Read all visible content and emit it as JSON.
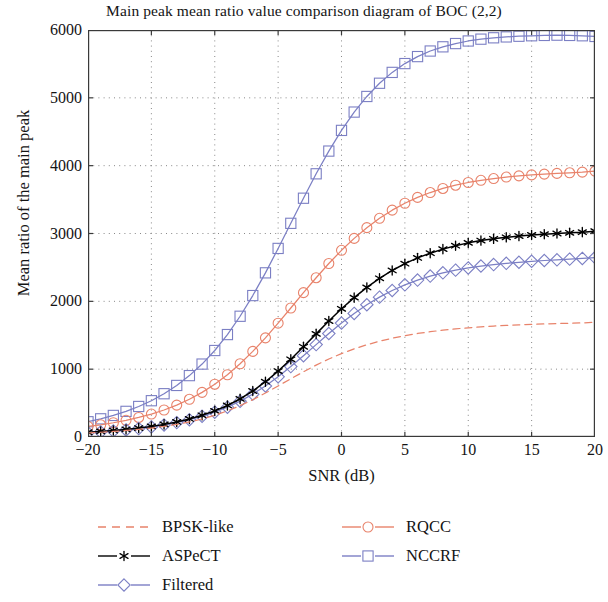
{
  "chart_data": {
    "type": "line",
    "title": "Main peak mean ratio value comparison diagram of BOC (2,2)",
    "xlabel": "SNR (dB)",
    "ylabel": "Mean ratio of the main peak",
    "xlim": [
      -20,
      20
    ],
    "ylim": [
      0,
      6000
    ],
    "xticks": [
      -20,
      -15,
      -10,
      -5,
      0,
      5,
      10,
      15,
      20
    ],
    "xticklabels": [
      "−20",
      "−15",
      "−10",
      "−5",
      "0",
      "5",
      "10",
      "15",
      "20"
    ],
    "yticks": [
      0,
      1000,
      2000,
      3000,
      4000,
      5000,
      6000
    ],
    "yticklabels": [
      "0",
      "1000",
      "2000",
      "3000",
      "4000",
      "5000",
      "6000"
    ],
    "grid": true,
    "grid_style": "dotted",
    "legend_position": "below-axes",
    "legend_columns": 2,
    "x": [
      -20,
      -19,
      -18,
      -17,
      -16,
      -15,
      -14,
      -13,
      -12,
      -11,
      -10,
      -9,
      -8,
      -7,
      -6,
      -5,
      -4,
      -3,
      -2,
      -1,
      0,
      1,
      2,
      3,
      4,
      5,
      6,
      7,
      8,
      9,
      10,
      11,
      12,
      13,
      14,
      15,
      16,
      17,
      18,
      19,
      20
    ],
    "series": [
      {
        "name": "BPSK-like",
        "color": "#E8836B",
        "line_style": "dashed",
        "marker": "none",
        "values": [
          60,
          70,
          82,
          96,
          112,
          132,
          156,
          186,
          222,
          266,
          320,
          385,
          462,
          550,
          648,
          752,
          858,
          962,
          1060,
          1150,
          1230,
          1300,
          1360,
          1412,
          1456,
          1494,
          1526,
          1552,
          1575,
          1594,
          1610,
          1624,
          1636,
          1646,
          1654,
          1661,
          1667,
          1672,
          1677,
          1682,
          1690
        ]
      },
      {
        "name": "ASPeCT",
        "color": "#000000",
        "line_style": "solid",
        "marker": "star",
        "values": [
          70,
          82,
          96,
          112,
          132,
          156,
          186,
          222,
          266,
          320,
          385,
          465,
          562,
          678,
          815,
          972,
          1145,
          1330,
          1520,
          1710,
          1890,
          2055,
          2205,
          2340,
          2455,
          2555,
          2640,
          2710,
          2770,
          2820,
          2862,
          2896,
          2922,
          2944,
          2962,
          2978,
          2990,
          3000,
          3010,
          3020,
          3035
        ]
      },
      {
        "name": "Filtered",
        "color": "#7B7FC4",
        "line_style": "solid",
        "marker": "diamond",
        "values": [
          62,
          74,
          88,
          104,
          124,
          148,
          177,
          212,
          254,
          305,
          366,
          440,
          528,
          632,
          752,
          888,
          1038,
          1198,
          1362,
          1525,
          1680,
          1822,
          1950,
          2062,
          2160,
          2243,
          2313,
          2372,
          2420,
          2460,
          2492,
          2520,
          2542,
          2560,
          2576,
          2590,
          2602,
          2612,
          2622,
          2632,
          2645
        ]
      },
      {
        "name": "RQCC",
        "color": "#E8836B",
        "line_style": "solid",
        "marker": "circle",
        "values": [
          155,
          180,
          210,
          246,
          288,
          338,
          398,
          470,
          556,
          658,
          778,
          918,
          1080,
          1262,
          1462,
          1678,
          1902,
          2128,
          2348,
          2558,
          2752,
          2928,
          3086,
          3224,
          3344,
          3446,
          3532,
          3604,
          3664,
          3712,
          3752,
          3784,
          3810,
          3832,
          3850,
          3864,
          3876,
          3886,
          3895,
          3905,
          3920
        ]
      },
      {
        "name": "NCCRF",
        "color": "#7B7FC4",
        "line_style": "solid",
        "marker": "square",
        "values": [
          225,
          268,
          318,
          378,
          450,
          535,
          638,
          760,
          905,
          1075,
          1275,
          1510,
          1780,
          2085,
          2420,
          2780,
          3150,
          3520,
          3880,
          4215,
          4520,
          4790,
          5020,
          5215,
          5375,
          5505,
          5608,
          5690,
          5752,
          5800,
          5838,
          5865,
          5885,
          5898,
          5908,
          5915,
          5920,
          5924,
          5920,
          5915,
          5905
        ]
      }
    ]
  },
  "legend": {
    "left_column": [
      {
        "label": "BPSK-like",
        "marker": "none",
        "line_style": "dashed",
        "color": "#E8836B"
      },
      {
        "label": "ASPeCT",
        "marker": "star",
        "line_style": "solid",
        "color": "#000000"
      },
      {
        "label": "Filtered",
        "marker": "diamond",
        "line_style": "solid",
        "color": "#7B7FC4"
      }
    ],
    "right_column": [
      {
        "label": "RQCC",
        "marker": "circle",
        "line_style": "solid",
        "color": "#E8836B"
      },
      {
        "label": "NCCRF",
        "marker": "square",
        "line_style": "solid",
        "color": "#7B7FC4"
      }
    ]
  },
  "style": {
    "axis_color": "#3a3a3a",
    "grid_color": "#7a7a7a",
    "background": "#ffffff",
    "text_color": "#141414"
  }
}
